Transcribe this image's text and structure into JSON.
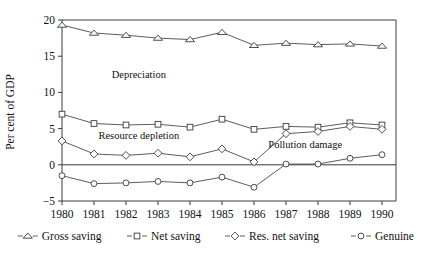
{
  "chart_data": {
    "type": "line",
    "title": "",
    "xlabel": "",
    "ylabel": "Per cent of GDP",
    "x": [
      1980,
      1981,
      1982,
      1983,
      1984,
      1985,
      1986,
      1987,
      1988,
      1989,
      1990
    ],
    "categories": [
      "1980",
      "1981",
      "1982",
      "1983",
      "1984",
      "1985",
      "1986",
      "1987",
      "1988",
      "1989",
      "1990"
    ],
    "ylim": [
      -5,
      20
    ],
    "yticks": [
      -5,
      0,
      5,
      10,
      15,
      20
    ],
    "yticklabels": [
      "−5",
      "0",
      "5",
      "10",
      "15",
      "20"
    ],
    "grid": false,
    "legend_position": "below-axis",
    "zero_line": true,
    "series": [
      {
        "name": "Gross saving",
        "marker": "triangle",
        "values": [
          19.3,
          18.2,
          17.9,
          17.5,
          17.3,
          18.3,
          16.5,
          16.8,
          16.6,
          16.7,
          16.4
        ]
      },
      {
        "name": "Net saving",
        "marker": "square",
        "values": [
          7.0,
          5.7,
          5.5,
          5.6,
          5.2,
          6.3,
          4.9,
          5.3,
          5.2,
          5.8,
          5.5
        ]
      },
      {
        "name": "Res. net saving",
        "marker": "diamond",
        "values": [
          3.3,
          1.5,
          1.3,
          1.6,
          1.1,
          2.2,
          0.4,
          4.3,
          4.6,
          5.3,
          4.9
        ]
      },
      {
        "name": "Genuine",
        "marker": "circle",
        "values": [
          -1.5,
          -2.6,
          -2.5,
          -2.3,
          -2.5,
          -1.7,
          -3.1,
          0.1,
          0.1,
          0.9,
          1.4
        ]
      }
    ],
    "annotations": [
      {
        "text": "Depreciation",
        "x": 1982.4,
        "y": 12.0
      },
      {
        "text": "Resource depletion",
        "x": 1982.4,
        "y": 3.5
      },
      {
        "text": "Pollution damage",
        "x": 1987.6,
        "y": 2.3
      }
    ]
  },
  "legend": {
    "items": [
      {
        "label": "Gross saving",
        "marker": "triangle"
      },
      {
        "label": "Net saving",
        "marker": "square"
      },
      {
        "label": "Res. net saving",
        "marker": "diamond"
      },
      {
        "label": "Genuine",
        "marker": "circle"
      }
    ]
  },
  "colors": {
    "axis": "#3a3a3a",
    "line": "#4a4a4a",
    "marker_fill": "#ffffff",
    "text": "#111111",
    "background": "#ffffff"
  }
}
